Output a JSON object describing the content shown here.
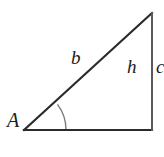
{
  "figure": {
    "type": "geometry-diagram",
    "shape": "right-triangle",
    "background_color": "#ffffff",
    "stroke_color": "#2b2b2b",
    "arc_color": "#7a7a7a",
    "labels": {
      "vertex_angle": "A",
      "hypotenuse": "b",
      "vertical_side": "h",
      "outer_side": "c"
    },
    "vertices": {
      "left": [
        24,
        130
      ],
      "apex": [
        152,
        13
      ],
      "right_angle": [
        152,
        130
      ]
    },
    "angle_arc": {
      "center": [
        24,
        130
      ],
      "radius": 42
    }
  }
}
